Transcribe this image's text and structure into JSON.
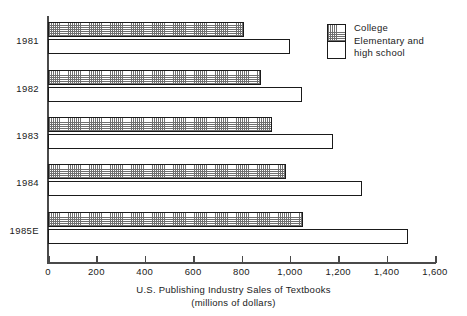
{
  "chart_data": {
    "type": "bar",
    "orientation": "horizontal",
    "title": "",
    "xlabel_line1": "U.S. Publishing Industry Sales of Textbooks",
    "xlabel_line2": "(millions of dollars)",
    "ylabel": "",
    "categories": [
      "1981",
      "1982",
      "1983",
      "1984",
      "1985E"
    ],
    "series": [
      {
        "name": "College",
        "key": "college",
        "pattern": "cross-hatch",
        "values": [
          810,
          880,
          925,
          985,
          1055
        ]
      },
      {
        "name": "Elementary and high school",
        "key": "school",
        "pattern": "solid-white",
        "values": [
          1000,
          1050,
          1180,
          1300,
          1490
        ]
      }
    ],
    "xlim": [
      0,
      1600
    ],
    "xticks": [
      0,
      200,
      400,
      600,
      800,
      1000,
      1200,
      1400,
      1600
    ],
    "xtick_labels": [
      "0",
      "200",
      "400",
      "600",
      "800",
      "1,000",
      "1,200",
      "1,400",
      "1,600"
    ],
    "grid": false,
    "legend_position": "top-right",
    "colors": {
      "outline": "#1a1a1a",
      "axis": "#4a4a4a",
      "hatch": "#6f6f6f",
      "background": "#ffffff"
    }
  },
  "legend": {
    "entries": [
      {
        "label": "College"
      },
      {
        "label": "Elementary and",
        "label2": "high school"
      }
    ],
    "line1": "College",
    "line2": "Elementary and",
    "line3": "high school"
  }
}
